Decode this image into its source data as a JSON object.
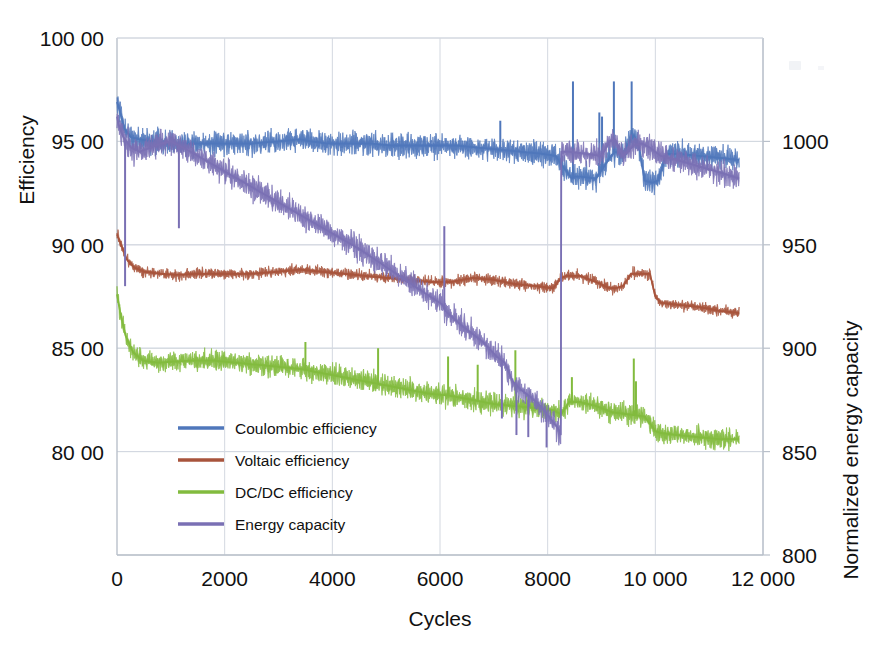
{
  "chart_data": {
    "type": "line",
    "title": "",
    "xlabel": "Cycles",
    "ylabel": "Efficiency",
    "y2label": "Normalized energy capacity",
    "xlim": [
      0,
      12000
    ],
    "ylim": [
      75,
      100
    ],
    "y2lim": [
      800,
      1050
    ],
    "grid": true,
    "legend_position": "lower-left-inside",
    "xticks": [
      "0",
      "2000",
      "4000",
      "6000",
      "8000",
      "10 000",
      "12 000"
    ],
    "xtick_values": [
      0,
      2000,
      4000,
      6000,
      8000,
      10000,
      12000
    ],
    "yticks": [
      "100 00",
      "95 00",
      "90 00",
      "85 00",
      "80 00"
    ],
    "ytick_values": [
      100,
      95,
      90,
      85,
      80
    ],
    "y2ticks": [
      "1000",
      "950",
      "900",
      "850",
      "800"
    ],
    "y2tick_values": [
      1000,
      950,
      900,
      850,
      800
    ],
    "series": [
      {
        "name": "Coulombic efficiency",
        "color": "#4f77bb",
        "axis": "left",
        "noise": 0.62,
        "x": [
          0,
          60,
          140,
          260,
          420,
          650,
          900,
          1200,
          1600,
          2000,
          2500,
          3000,
          3400,
          3600,
          3900,
          4300,
          4700,
          5100,
          5500,
          5900,
          6300,
          6700,
          7100,
          7500,
          7900,
          8150,
          8250,
          8450,
          8500,
          8600,
          8900,
          9150,
          9250,
          9400,
          9500,
          9600,
          9700,
          9800,
          9950,
          10050,
          10200,
          10400,
          10800,
          11200,
          11560
        ],
        "values": [
          96.9,
          96.4,
          95.6,
          95.2,
          95.1,
          95.0,
          94.9,
          94.9,
          94.9,
          94.9,
          94.9,
          95.0,
          95.1,
          95.0,
          94.9,
          94.9,
          94.9,
          94.8,
          94.8,
          94.8,
          94.8,
          94.7,
          94.6,
          94.5,
          94.4,
          94.3,
          93.9,
          93.2,
          93.3,
          93.3,
          93.2,
          94.2,
          94.5,
          94.4,
          94.9,
          95.3,
          94.7,
          93.1,
          93.0,
          93.1,
          94.4,
          94.4,
          94.3,
          94.2,
          94.1
        ],
        "spikes": [
          {
            "x": 8470,
            "y": 97.9
          },
          {
            "x": 9230,
            "y": 97.9
          },
          {
            "x": 9560,
            "y": 97.9
          },
          {
            "x": 8960,
            "y": 96.4
          },
          {
            "x": 9010,
            "y": 96.2
          },
          {
            "x": 7120,
            "y": 96.0
          }
        ]
      },
      {
        "name": "Voltaic efficiency",
        "color": "#a8543c",
        "axis": "left",
        "noise": 0.3,
        "x": [
          0,
          80,
          180,
          320,
          500,
          800,
          1100,
          1500,
          2000,
          2500,
          3000,
          3400,
          3800,
          4200,
          4600,
          5000,
          5400,
          5800,
          6200,
          6600,
          7000,
          7400,
          7800,
          8100,
          8250,
          8350,
          8600,
          8900,
          9150,
          9250,
          9400,
          9550,
          9650,
          9750,
          9900,
          10000,
          10100,
          10400,
          10800,
          11200,
          11560
        ],
        "values": [
          90.5,
          90.0,
          89.3,
          88.9,
          88.7,
          88.6,
          88.55,
          88.6,
          88.6,
          88.6,
          88.7,
          88.8,
          88.7,
          88.6,
          88.5,
          88.4,
          88.3,
          88.2,
          88.2,
          88.4,
          88.3,
          88.1,
          88.0,
          87.9,
          88.4,
          88.5,
          88.5,
          88.2,
          87.9,
          87.9,
          88.0,
          88.6,
          88.6,
          88.6,
          88.6,
          87.5,
          87.2,
          87.1,
          87.0,
          86.8,
          86.7
        ]
      },
      {
        "name": "DC/DC efficiency",
        "color": "#82bb3e",
        "axis": "left",
        "noise": 0.55,
        "x": [
          0,
          70,
          160,
          300,
          480,
          750,
          1050,
          1400,
          1800,
          2200,
          2600,
          3000,
          3400,
          3800,
          4200,
          4600,
          5000,
          5400,
          5800,
          6200,
          6600,
          7000,
          7400,
          7800,
          8100,
          8250,
          8400,
          8600,
          8900,
          9200,
          9500,
          9800,
          10000,
          10100,
          10400,
          10800,
          11200,
          11560
        ],
        "values": [
          87.6,
          86.6,
          85.6,
          84.8,
          84.4,
          84.3,
          84.35,
          84.4,
          84.4,
          84.3,
          84.2,
          84.1,
          84.0,
          83.8,
          83.6,
          83.4,
          83.2,
          83.0,
          82.8,
          82.7,
          82.5,
          82.3,
          82.2,
          82.1,
          82.0,
          81.8,
          82.4,
          82.4,
          82.2,
          81.9,
          81.8,
          81.7,
          81.0,
          80.9,
          80.8,
          80.7,
          80.6,
          80.6
        ],
        "spikes": [
          {
            "x": 3500,
            "y": 85.3
          },
          {
            "x": 4850,
            "y": 85.0
          },
          {
            "x": 6150,
            "y": 84.6
          },
          {
            "x": 6700,
            "y": 84.2
          },
          {
            "x": 7400,
            "y": 84.9
          },
          {
            "x": 8450,
            "y": 83.6
          },
          {
            "x": 9600,
            "y": 84.5
          },
          {
            "x": 9640,
            "y": 83.4
          }
        ]
      },
      {
        "name": "Energy capacity",
        "color": "#7a70b4",
        "axis": "right",
        "noise": 6.5,
        "x": [
          0,
          30,
          120,
          260,
          420,
          620,
          820,
          1000,
          1300,
          1700,
          2100,
          2500,
          2900,
          3300,
          3700,
          4100,
          4500,
          4900,
          5300,
          5700,
          6050,
          6100,
          6400,
          6800,
          7050,
          7200,
          7350,
          7500,
          7700,
          7900,
          8050,
          8200,
          8249,
          8251,
          8400,
          8700,
          9000,
          9150,
          9250,
          9400,
          9600,
          9750,
          9900,
          10100,
          10400,
          10800,
          11200,
          11560
        ],
        "values": [
          1012,
          1008,
          1002,
          997,
          995,
          997,
          999,
          1000,
          996,
          990,
          984,
          978,
          972,
          966,
          960,
          954,
          948,
          941,
          934,
          927,
          921,
          918,
          911,
          903,
          896,
          893,
          884,
          880,
          876,
          871,
          866,
          861,
          858,
          995,
          995,
          994,
          993,
          1000,
          1001,
          993,
          998,
          999,
          997,
          993,
          991,
          988,
          985,
          982
        ],
        "spikes": [
          {
            "x": 150,
            "y": 930
          },
          {
            "x": 1150,
            "y": 958
          },
          {
            "x": 6080,
            "y": 959
          },
          {
            "x": 7150,
            "y": 866
          },
          {
            "x": 7420,
            "y": 858
          },
          {
            "x": 7640,
            "y": 857
          },
          {
            "x": 7980,
            "y": 852
          }
        ]
      }
    ]
  },
  "legend": {
    "items": [
      {
        "label": "Coulombic efficiency"
      },
      {
        "label": "Voltaic efficiency"
      },
      {
        "label": "DC/DC efficiency"
      },
      {
        "label": "Energy capacity"
      }
    ]
  }
}
